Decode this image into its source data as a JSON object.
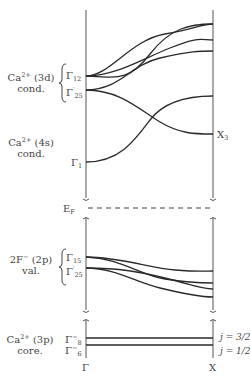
{
  "diagram": {
    "type": "band-structure",
    "x_axis": {
      "left_label": "Γ",
      "right_label": "X"
    },
    "fermi_label": "E_F",
    "groups": [
      {
        "id": "ca3d",
        "line1": "Ca²⁺ (3d)",
        "line2": "cond.",
        "levels": [
          "Γ12",
          "Γ'25"
        ]
      },
      {
        "id": "ca4s",
        "line1": "Ca²⁺ (4s)",
        "line2": "cond.",
        "levels": [
          "Γ1"
        ],
        "right_level": "X3"
      },
      {
        "id": "f2p",
        "line1": "2F⁻ (2p)",
        "line2": "val.",
        "levels": [
          "Γ15",
          "Γ'25"
        ]
      },
      {
        "id": "ca3p",
        "line1": "Ca²⁺ (3p)",
        "line2": "core.",
        "levels": [
          "Γ8⁻",
          "Γ6⁻"
        ],
        "right_labels": [
          "j = 3/2",
          "j = 1/2"
        ]
      }
    ]
  },
  "labels": {
    "ca3d_1": "Ca",
    "ca3d_1sup": "2+",
    "ca3d_1b": " (3d)",
    "ca3d_2": "cond.",
    "g12": "Γ",
    "g12sub": "12",
    "g25": "Γ",
    "g25sup": "′",
    "g25sub": "25",
    "ca4s_1": "Ca",
    "ca4s_1sup": "2+",
    "ca4s_1b": " (4s)",
    "ca4s_2": "cond.",
    "g1": "Γ",
    "g1sub": "1",
    "x3": "X",
    "x3sub": "3",
    "ef": "E",
    "efsub": "F",
    "f2p_1": "2F",
    "f2p_1sup": "−",
    "f2p_1b": " (2p)",
    "f2p_2": "val.",
    "g15": "Γ",
    "g15sub": "15",
    "g25v": "Γ",
    "g25vsup": "′",
    "g25vsub": "25",
    "ca3p_1": "Ca",
    "ca3p_1sup": "2+",
    "ca3p_1b": " (3p)",
    "ca3p_2": "core.",
    "g8": "Γ",
    "g8sup": "−",
    "g8sub": "8",
    "g6": "Γ",
    "g6sup": "−",
    "g6sub": "6",
    "j32": "j = 3/2",
    "j12": "j = 1/2",
    "gamma": "Γ",
    "xpt": "X"
  }
}
